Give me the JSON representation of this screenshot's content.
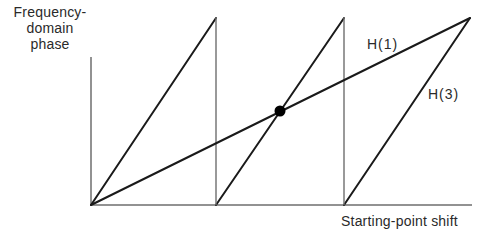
{
  "diagram": {
    "title": "",
    "y_axis": {
      "label_lines": [
        "Frequency-",
        "domain",
        "phase"
      ]
    },
    "x_axis": {
      "label": "Starting-point shift"
    },
    "series": [
      {
        "name": "H(1)",
        "label": "H(1)",
        "description": "single linear ramp from origin to top right",
        "points": [
          [
            91,
            205
          ],
          [
            470,
            18
          ]
        ]
      },
      {
        "name": "H(3)",
        "label": "H(3)",
        "description": "sawtooth of three ramps wrapping at full phase",
        "segments": [
          [
            [
              91,
              205
            ],
            [
              216,
              18
            ]
          ],
          [
            [
              216,
              205
            ],
            [
              344,
              18
            ]
          ],
          [
            [
              344,
              205
            ],
            [
              470,
              18
            ]
          ]
        ],
        "wrap_drops": [
          [
            [
              216,
              18
            ],
            [
              216,
              205
            ]
          ],
          [
            [
              344,
              18
            ],
            [
              344,
              205
            ]
          ]
        ]
      }
    ],
    "marker": {
      "name": "intersection-point",
      "x": 280,
      "y": 111,
      "color": "#000000"
    },
    "colors": {
      "line": "#1a1a1a",
      "axis": "#6e6e6e",
      "background": "#ffffff"
    }
  }
}
